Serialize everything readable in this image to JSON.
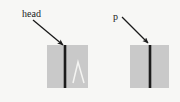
{
  "figure": {
    "background_color": "#f7f7f5",
    "caption_labels": {
      "head_label": "head",
      "p_label": "p"
    },
    "panels": [
      {
        "name": "left-panel",
        "x": 47,
        "y": 45,
        "width": 41,
        "height": 43,
        "fill_color": "#c9c9c9",
        "divider_line": {
          "x": 65,
          "color": "#1c1c1c",
          "width": 2.6
        },
        "trace": {
          "shape": "peak",
          "color": "#f2f2f0",
          "apex_x": 78,
          "apex_y": 62,
          "left_x": 73,
          "right_x": 84,
          "base_y": 83
        },
        "annotation": {
          "label": "head",
          "label_x": 22,
          "label_y": 17,
          "arrow_from_x": 33,
          "arrow_from_y": 20,
          "arrow_to_x": 64,
          "arrow_to_y": 46,
          "arrow_color": "#1a1a1a"
        }
      },
      {
        "name": "right-panel",
        "x": 130,
        "y": 45,
        "width": 39,
        "height": 43,
        "fill_color": "#c9c9c9",
        "divider_line": {
          "x": 150,
          "color": "#1c1c1c",
          "width": 2.6
        },
        "trace": null,
        "annotation": {
          "label": "p",
          "label_x": 113,
          "label_y": 20,
          "arrow_from_x": 122,
          "arrow_from_y": 17,
          "arrow_to_x": 149,
          "arrow_to_y": 44,
          "arrow_color": "#1a1a1a"
        }
      }
    ]
  }
}
